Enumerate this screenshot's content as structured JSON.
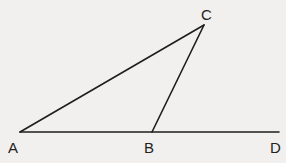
{
  "diagram": {
    "type": "geometry-triangle",
    "points": {
      "A": {
        "label": "A",
        "x": 20,
        "y": 132
      },
      "B": {
        "label": "B",
        "x": 152,
        "y": 132
      },
      "C": {
        "label": "C",
        "x": 204,
        "y": 25
      },
      "D": {
        "label": "D",
        "x": 279,
        "y": 132
      }
    },
    "segments": [
      "AC",
      "BC",
      "AD"
    ],
    "colors": {
      "line": "#1e1e1e",
      "background": "#f1f0ee"
    }
  }
}
